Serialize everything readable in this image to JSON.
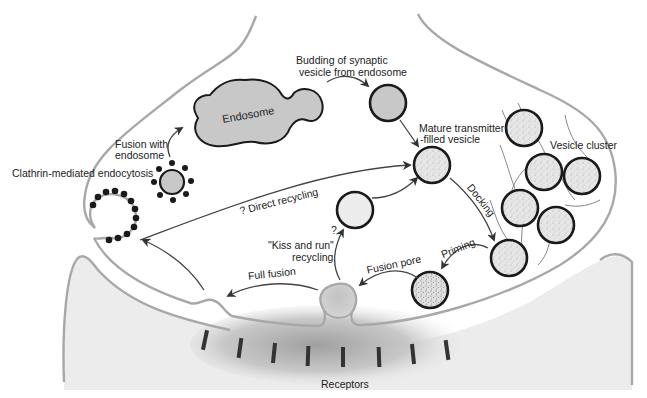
{
  "diagram": {
    "labels": {
      "endosome": "Endosome",
      "budding_line1": "Budding of synaptic",
      "budding_line2": "vesicle from endosome",
      "fusion_endosome_line1": "Fusion with",
      "fusion_endosome_line2": "endosome",
      "clathrin": "Clathrin-mediated endocytosis",
      "mature_line1": "Mature transmitter",
      "mature_line2": "-filled vesicle",
      "vesicle_cluster": "Vesicle cluster",
      "direct_recycling": "? Direct recycling",
      "docking": "Docking",
      "priming": "Priming",
      "fusion_pore": "Fusion pore",
      "kiss_question": "?",
      "kiss_line1": "\"Kiss and run\"",
      "kiss_line2": "recycling",
      "full_fusion": "Full fusion",
      "receptors": "Receptors"
    },
    "colors": {
      "membrane": "#a8a8a8",
      "postsynaptic_fill": "#ececec",
      "endosome_fill": "#c8c8c8",
      "vesicle_fill": "#e4e4e4",
      "clathrin_dot": "#1a1a1a",
      "receptor": "#333333"
    },
    "nodes": [
      {
        "id": "endosome",
        "label": "Endosome"
      },
      {
        "id": "budded-vesicle",
        "label": "Budding of synaptic vesicle from endosome"
      },
      {
        "id": "mature-vesicle",
        "label": "Mature transmitter-filled vesicle"
      },
      {
        "id": "vesicle-cluster",
        "label": "Vesicle cluster"
      },
      {
        "id": "docked-vesicle",
        "label": "Docking"
      },
      {
        "id": "primed-vesicle",
        "label": "Priming"
      },
      {
        "id": "fusion-pore-vesicle",
        "label": "Fusion pore"
      },
      {
        "id": "kiss-run-vesicle",
        "label": "\"Kiss and run\" recycling"
      },
      {
        "id": "coated-pit",
        "label": "Clathrin-mediated endocytosis"
      },
      {
        "id": "coated-vesicle",
        "label": "Fusion with endosome"
      },
      {
        "id": "receptors",
        "label": "Receptors"
      }
    ],
    "edges": [
      {
        "from": "coated-vesicle",
        "to": "endosome",
        "label": "Fusion with endosome"
      },
      {
        "from": "endosome",
        "to": "budded-vesicle",
        "label": "Budding of synaptic vesicle from endosome"
      },
      {
        "from": "budded-vesicle",
        "to": "mature-vesicle",
        "label": ""
      },
      {
        "from": "coated-pit",
        "to": "mature-vesicle",
        "label": "? Direct recycling"
      },
      {
        "from": "mature-vesicle",
        "to": "docked-vesicle",
        "label": "Docking"
      },
      {
        "from": "docked-vesicle",
        "to": "primed-vesicle",
        "label": "Priming"
      },
      {
        "from": "primed-vesicle",
        "to": "fusion-pore-vesicle",
        "label": "Fusion pore"
      },
      {
        "from": "fusion-pore-vesicle",
        "to": "kiss-run-vesicle",
        "label": "? \"Kiss and run\" recycling"
      },
      {
        "from": "kiss-run-vesicle",
        "to": "mature-vesicle",
        "label": ""
      },
      {
        "from": "fusion-pore-vesicle",
        "to": "membrane-flattened",
        "label": "Full fusion"
      },
      {
        "from": "membrane-flattened",
        "to": "coated-pit",
        "label": ""
      },
      {
        "from": "coated-pit",
        "to": "coated-vesicle",
        "label": ""
      }
    ]
  }
}
